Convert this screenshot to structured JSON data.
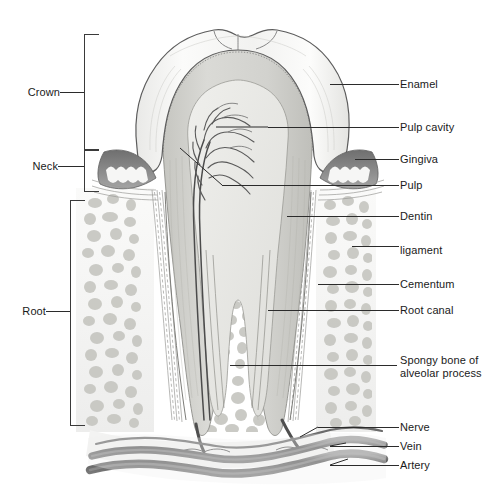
{
  "figure": {
    "background_color": "#ffffff",
    "line_color": "#2b2b2b",
    "text_color": "#1a1a1a",
    "width": 504,
    "height": 493
  },
  "left_labels": [
    {
      "id": "crown",
      "text": "Crown",
      "x": 22,
      "y": 86,
      "leader_x1": 60,
      "leader_x2": 84,
      "leader_y": 92,
      "bracket_top": 34,
      "bracket_bottom": 148
    },
    {
      "id": "neck",
      "text": "Neck",
      "x": 26,
      "y": 160,
      "leader_x1": 58,
      "leader_x2": 84,
      "leader_y": 166,
      "bracket_top": 150,
      "bracket_bottom": 190
    },
    {
      "id": "root",
      "text": "Root",
      "x": 26,
      "y": 305,
      "leader_x1": 58,
      "leader_x2": 70,
      "leader_y": 311,
      "bracket_top": 200,
      "bracket_bottom": 424
    }
  ],
  "right_labels": [
    {
      "id": "enamel",
      "text": "Enamel",
      "x": 400,
      "y": 78,
      "leader_x1": 330,
      "leader_x2": 399,
      "leader_y": 84,
      "anchor_x": 305,
      "anchor_y": 93
    },
    {
      "id": "pulp-cavity",
      "text": "Pulp cavity",
      "x": 400,
      "y": 121,
      "leader_x1": 268,
      "leader_x2": 399,
      "leader_y": 127,
      "anchor_x": 268,
      "anchor_y": 127
    },
    {
      "id": "gingiva",
      "text": "Gingiva",
      "x": 400,
      "y": 153,
      "leader_x1": 355,
      "leader_x2": 399,
      "leader_y": 159,
      "anchor_x": 330,
      "anchor_y": 159
    },
    {
      "id": "pulp",
      "text": "Pulp",
      "x": 400,
      "y": 179,
      "leader_x1": 222,
      "leader_x2": 399,
      "leader_y": 185,
      "anchor_x": 222,
      "anchor_y": 185
    },
    {
      "id": "dentin",
      "text": "Dentin",
      "x": 400,
      "y": 210,
      "leader_x1": 287,
      "leader_x2": 399,
      "leader_y": 216,
      "anchor_x": 287,
      "anchor_y": 216
    },
    {
      "id": "ligament",
      "text": "ligament",
      "x": 400,
      "y": 246,
      "leader_x1": 352,
      "leader_x2": 399,
      "leader_y": 246,
      "anchor_x": 352,
      "anchor_y": 246
    },
    {
      "id": "cementum",
      "text": "Cementum",
      "x": 400,
      "y": 278,
      "leader_x1": 318,
      "leader_x2": 399,
      "leader_y": 284,
      "anchor_x": 318,
      "anchor_y": 284
    },
    {
      "id": "root-canal",
      "text": "Root canal",
      "x": 400,
      "y": 304,
      "leader_x1": 268,
      "leader_x2": 399,
      "leader_y": 310,
      "anchor_x": 268,
      "anchor_y": 310
    },
    {
      "id": "spongy-bone",
      "text": "Spongy bone of\nalveolar process",
      "x": 400,
      "y": 354,
      "leader_x1": 230,
      "leader_x2": 397,
      "leader_y": 365,
      "anchor_x": 230,
      "anchor_y": 365
    },
    {
      "id": "nerve",
      "text": "Nerve",
      "x": 400,
      "y": 420,
      "leader_x1": 310,
      "leader_x2": 399,
      "leader_y": 428,
      "anchor_x": 310,
      "anchor_y": 436
    },
    {
      "id": "vein",
      "text": "Vein",
      "x": 400,
      "y": 440,
      "leader_x1": 330,
      "leader_x2": 399,
      "leader_y": 446,
      "anchor_x": 330,
      "anchor_y": 444
    },
    {
      "id": "artery",
      "text": "Artery",
      "x": 400,
      "y": 459,
      "leader_x1": 330,
      "leader_x2": 399,
      "leader_y": 465,
      "anchor_x": 330,
      "anchor_y": 458
    }
  ],
  "structures": {
    "enamel_fill": "#f4f4f2",
    "dentin_fill": "#d6d6d2",
    "pulp_fill": "#e9e9e6",
    "gingiva_fill": "#8d8d8d",
    "bone_fill": "#f7f7f6",
    "bone_spicule_fill": "#c9c9c5",
    "vessel_dark": "#5d5d5d",
    "vessel_mid": "#8a8a8a",
    "outline": "#4a4a4a"
  }
}
